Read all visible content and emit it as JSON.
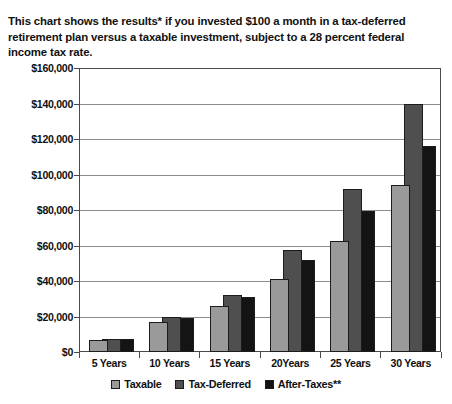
{
  "intro": {
    "text": "This chart shows the results* if you invested $100 a month in a tax-deferred retirement plan versus a taxable investment, subject to a 28 percent federal income tax rate."
  },
  "colors": {
    "taxable": "#9a9a9a",
    "tax_deferred": "#4f4f4f",
    "after_taxes": "#141414",
    "axis": "#4a4a4a",
    "gridline": "#8d8d8d",
    "background": "#ffffff"
  },
  "legend": {
    "position": "bottom-center",
    "items": [
      {
        "label": "Taxable",
        "swatch": "taxable"
      },
      {
        "label": "Tax-Deferred",
        "swatch": "deferred"
      },
      {
        "label": "After-Taxes**",
        "swatch": "aftertax"
      }
    ]
  },
  "chart_data": {
    "type": "bar",
    "title": "",
    "xlabel": "",
    "ylabel": "",
    "grid": true,
    "ylim": [
      0,
      160000
    ],
    "ytick_step": 20000,
    "ytick_labels": [
      "$160,000",
      "$140,000",
      "$120,000",
      "$100,000",
      "$80,000",
      "$60,000",
      "$40,000",
      "$20,000",
      "$0"
    ],
    "ytick_values": [
      160000,
      140000,
      120000,
      100000,
      80000,
      60000,
      40000,
      20000,
      0
    ],
    "categories": [
      "5 Years",
      "10 Years",
      "15 Years",
      "20Years",
      "25 Years",
      "30 Years"
    ],
    "series": [
      {
        "name": "Taxable",
        "values": [
          7000,
          17000,
          26000,
          41000,
          62500,
          94000
        ]
      },
      {
        "name": "Tax-Deferred",
        "values": [
          7400,
          19500,
          32000,
          57500,
          92000,
          139500
        ]
      },
      {
        "name": "After-Taxes**",
        "values": [
          7300,
          19000,
          31000,
          52000,
          79500,
          116000
        ]
      }
    ]
  },
  "bottom_strip": {
    "text": ""
  }
}
